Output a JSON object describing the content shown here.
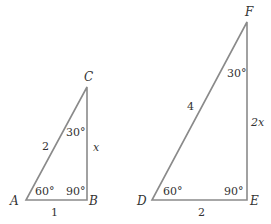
{
  "triangles": [
    {
      "name": "ABC",
      "vertices": {
        "A": "A",
        "B": "B",
        "C": "C"
      },
      "angles": {
        "A": "60°",
        "B": "90°",
        "C": "30°"
      },
      "sides": {
        "AC": "2",
        "AB": "1",
        "BC": "x"
      }
    },
    {
      "name": "DEF",
      "vertices": {
        "D": "D",
        "E": "E",
        "F": "F"
      },
      "angles": {
        "D": "60°",
        "E": "90°",
        "F": "30°"
      },
      "sides": {
        "DF": "4",
        "DE": "2",
        "EF": "2x"
      }
    }
  ]
}
